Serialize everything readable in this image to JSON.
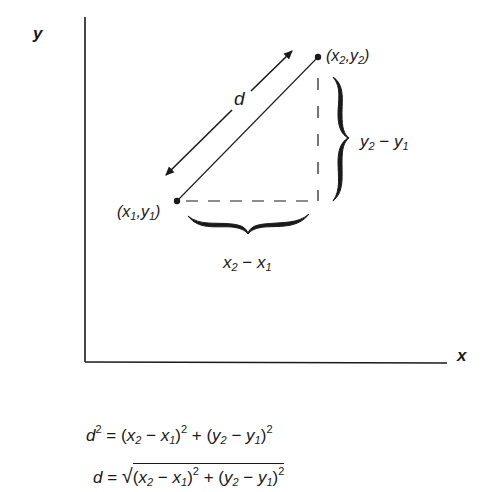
{
  "axes": {
    "x_label": "x",
    "y_label": "y"
  },
  "points": {
    "p1": {
      "label_open": "(",
      "x": "x",
      "x_sub": "1",
      "sep": ",",
      "y": "y",
      "y_sub": "1",
      "label_close": ")"
    },
    "p2": {
      "label_open": "(",
      "x": "x",
      "x_sub": "2",
      "sep": ",",
      "y": "y",
      "y_sub": "2",
      "label_close": ")"
    }
  },
  "distance_label": "d",
  "dx_label": {
    "a": "x",
    "a_sub": "2",
    "op": " − ",
    "b": "x",
    "b_sub": "1"
  },
  "dy_label": {
    "a": "y",
    "a_sub": "2",
    "op": " − ",
    "b": "y",
    "b_sub": "1"
  },
  "equations": {
    "eq1": {
      "lhs": "d",
      "lhs_sup": "2",
      "eq": " = ",
      "t1_open": "(",
      "t1_a": "x",
      "t1_a_sub": "2",
      "t1_op": " − ",
      "t1_b": "x",
      "t1_b_sub": "1",
      "t1_close": ")",
      "t1_sup": "2",
      "plus": " + ",
      "t2_open": "(",
      "t2_a": "y",
      "t2_a_sub": "2",
      "t2_op": " − ",
      "t2_b": "y",
      "t2_b_sub": "1",
      "t2_close": ")",
      "t2_sup": "2"
    },
    "eq2": {
      "lhs": "d",
      "eq": " = ",
      "radical": "√",
      "t1_open": "(",
      "t1_a": "x",
      "t1_a_sub": "2",
      "t1_op": " − ",
      "t1_b": "x",
      "t1_b_sub": "1",
      "t1_close": ")",
      "t1_sup": "2",
      "plus": " + ",
      "t2_open": "(",
      "t2_a": "y",
      "t2_a_sub": "2",
      "t2_op": " − ",
      "t2_b": "y",
      "t2_b_sub": "1",
      "t2_close": ")",
      "t2_sup": "2"
    }
  },
  "colors": {
    "ink": "#1a1a1a",
    "background": "#ffffff"
  }
}
